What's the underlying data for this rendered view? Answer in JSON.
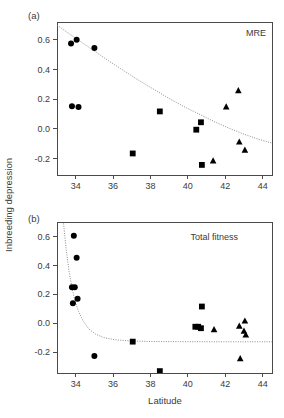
{
  "figure": {
    "y_axis_label": "Inbreeding depression",
    "x_axis_label": "Latitude",
    "panel_a_label": "(a)",
    "panel_b_label": "(b)",
    "panel_a_annotation": "MRE",
    "panel_b_annotation": "Total fitness",
    "point_color": "#000000",
    "curve_color": "#8d8d8d",
    "axis_color": "#4a4a4a",
    "text_color": "#3b3b3b"
  },
  "chart_data": [
    {
      "type": "scatter",
      "panel": "(a)",
      "title": "MRE",
      "xlabel": "Latitude",
      "ylabel": "Inbreeding depression",
      "xlim": [
        33.0,
        44.5
      ],
      "ylim": [
        -0.31,
        0.72
      ],
      "xticks": [
        34,
        36,
        38,
        40,
        42,
        44
      ],
      "xtick_labels": [
        "34",
        "36",
        "38",
        "40",
        "42",
        "44"
      ],
      "yticks": [
        -0.2,
        0.0,
        0.2,
        0.4,
        0.6
      ],
      "ytick_labels": [
        "-0.2",
        "0.0",
        "0.2",
        "0.4",
        "0.6"
      ],
      "grid": false,
      "legend": "none",
      "series": [
        {
          "name": "circle-group",
          "marker": "circle",
          "points": [
            {
              "x": 33.75,
              "y": 0.575
            },
            {
              "x": 34.05,
              "y": 0.6
            },
            {
              "x": 35.0,
              "y": 0.545
            },
            {
              "x": 33.8,
              "y": 0.152
            },
            {
              "x": 34.15,
              "y": 0.147
            }
          ]
        },
        {
          "name": "square-group",
          "marker": "square",
          "points": [
            {
              "x": 37.05,
              "y": -0.165
            },
            {
              "x": 38.5,
              "y": 0.118
            },
            {
              "x": 40.45,
              "y": -0.005
            },
            {
              "x": 40.7,
              "y": 0.045
            },
            {
              "x": 40.75,
              "y": -0.242
            }
          ]
        },
        {
          "name": "triangle-group",
          "marker": "triangle",
          "points": [
            {
              "x": 41.35,
              "y": -0.215
            },
            {
              "x": 42.05,
              "y": 0.148
            },
            {
              "x": 42.7,
              "y": 0.258
            },
            {
              "x": 42.75,
              "y": -0.088
            },
            {
              "x": 43.05,
              "y": -0.142
            }
          ]
        }
      ],
      "fit_curve": {
        "name": "fitted-decline-curve",
        "style": "dotted",
        "points": [
          {
            "x": 33.0,
            "y": 0.7
          },
          {
            "x": 33.6,
            "y": 0.645
          },
          {
            "x": 34.3,
            "y": 0.585
          },
          {
            "x": 35.0,
            "y": 0.525
          },
          {
            "x": 35.8,
            "y": 0.455
          },
          {
            "x": 36.6,
            "y": 0.39
          },
          {
            "x": 37.4,
            "y": 0.325
          },
          {
            "x": 38.2,
            "y": 0.265
          },
          {
            "x": 39.0,
            "y": 0.205
          },
          {
            "x": 39.8,
            "y": 0.15
          },
          {
            "x": 40.6,
            "y": 0.1
          },
          {
            "x": 41.4,
            "y": 0.05
          },
          {
            "x": 42.2,
            "y": 0.005
          },
          {
            "x": 43.0,
            "y": -0.035
          },
          {
            "x": 43.8,
            "y": -0.07
          },
          {
            "x": 44.5,
            "y": -0.095
          }
        ]
      }
    },
    {
      "type": "scatter",
      "panel": "(b)",
      "title": "Total fitness",
      "xlabel": "Latitude",
      "ylabel": "Inbreeding depression",
      "xlim": [
        33.0,
        44.5
      ],
      "ylim": [
        -0.345,
        0.7
      ],
      "xticks": [
        34,
        36,
        38,
        40,
        42,
        44
      ],
      "xtick_labels": [
        "34",
        "36",
        "38",
        "40",
        "42",
        "44"
      ],
      "yticks": [
        -0.2,
        0.0,
        0.2,
        0.4,
        0.6
      ],
      "ytick_labels": [
        "-0.2",
        "0.0",
        "0.2",
        "0.4",
        "0.6"
      ],
      "grid": false,
      "legend": "none",
      "series": [
        {
          "name": "circle-group",
          "marker": "circle",
          "points": [
            {
              "x": 33.9,
              "y": 0.605
            },
            {
              "x": 34.05,
              "y": 0.452
            },
            {
              "x": 33.8,
              "y": 0.248
            },
            {
              "x": 33.95,
              "y": 0.248
            },
            {
              "x": 34.1,
              "y": 0.168
            },
            {
              "x": 33.85,
              "y": 0.138
            },
            {
              "x": 35.0,
              "y": -0.228
            }
          ]
        },
        {
          "name": "square-group",
          "marker": "square",
          "points": [
            {
              "x": 37.05,
              "y": -0.128
            },
            {
              "x": 38.5,
              "y": -0.332
            },
            {
              "x": 40.4,
              "y": -0.025
            },
            {
              "x": 40.55,
              "y": -0.025
            },
            {
              "x": 40.7,
              "y": -0.035
            },
            {
              "x": 40.75,
              "y": 0.115
            }
          ]
        },
        {
          "name": "triangle-group",
          "marker": "triangle",
          "points": [
            {
              "x": 41.4,
              "y": -0.045
            },
            {
              "x": 42.75,
              "y": -0.02
            },
            {
              "x": 43.05,
              "y": 0.015
            },
            {
              "x": 43.0,
              "y": -0.055
            },
            {
              "x": 43.1,
              "y": -0.082
            },
            {
              "x": 42.8,
              "y": -0.245
            }
          ]
        }
      ],
      "fit_curve": {
        "name": "fitted-decline-curve",
        "style": "dotted",
        "points": [
          {
            "x": 33.35,
            "y": 0.69
          },
          {
            "x": 33.5,
            "y": 0.5
          },
          {
            "x": 33.65,
            "y": 0.355
          },
          {
            "x": 33.8,
            "y": 0.245
          },
          {
            "x": 33.95,
            "y": 0.16
          },
          {
            "x": 34.15,
            "y": 0.082
          },
          {
            "x": 34.4,
            "y": 0.015
          },
          {
            "x": 34.7,
            "y": -0.04
          },
          {
            "x": 35.05,
            "y": -0.075
          },
          {
            "x": 35.5,
            "y": -0.1
          },
          {
            "x": 36.1,
            "y": -0.115
          },
          {
            "x": 36.9,
            "y": -0.123
          },
          {
            "x": 38.0,
            "y": -0.127
          },
          {
            "x": 39.5,
            "y": -0.128
          },
          {
            "x": 41.5,
            "y": -0.129
          },
          {
            "x": 44.5,
            "y": -0.129
          }
        ]
      }
    }
  ]
}
